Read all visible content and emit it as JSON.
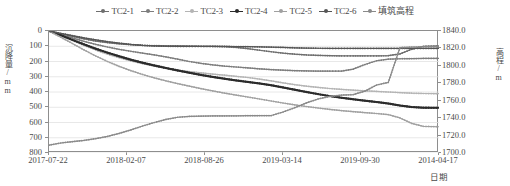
{
  "legend": {
    "items": [
      {
        "label": "TC2-1",
        "color": "#6e6e6e",
        "marker": "dot"
      },
      {
        "label": "TC2-2",
        "color": "#7d7d7d",
        "marker": "dot"
      },
      {
        "label": "TC2-3",
        "color": "#b4b4b4",
        "marker": "dot"
      },
      {
        "label": "TC2-4",
        "color": "#2b2b2b",
        "marker": "dot"
      },
      {
        "label": "TC2-5",
        "color": "#a0a0a0",
        "marker": "dot"
      },
      {
        "label": "TC2-6",
        "color": "#555555",
        "marker": "dot"
      },
      {
        "label": "填筑高程",
        "color": "#8a8a8a",
        "marker": "dot"
      }
    ]
  },
  "axes": {
    "y_left_title": "沉降量/mm",
    "y_right_title": "高程/m",
    "x_title": "日期",
    "y_left_ticks": [
      "0",
      "100",
      "200",
      "300",
      "400",
      "500",
      "600",
      "700",
      "800"
    ],
    "y_right_ticks": [
      "1840.0",
      "1820.0",
      "1800.0",
      "1780.0",
      "1760.0",
      "1740.0",
      "1720.0",
      "1700.0"
    ],
    "x_ticks": [
      "2017-07-22",
      "2018-02-07",
      "2018-08-26",
      "2019-03-14",
      "2019-09-30",
      "2014-04-17"
    ]
  },
  "chart_data": {
    "type": "line",
    "title": "",
    "xlabel": "日期",
    "ylabel": "沉降量/mm",
    "y2label": "高程/m",
    "grid": true,
    "legend_position": "top",
    "ylim": [
      800,
      0
    ],
    "y2lim": [
      1700.0,
      1840.0
    ],
    "xlim": [
      "2017-07-22",
      "2014-04-17"
    ],
    "x_tick_labels": [
      "2017-07-22",
      "2018-02-07",
      "2018-08-26",
      "2019-03-14",
      "2019-09-30",
      "2014-04-17"
    ],
    "x": [
      0,
      3,
      6,
      9,
      12,
      15,
      18,
      21,
      24,
      27,
      30,
      33,
      36,
      39,
      42,
      45,
      48,
      51,
      54,
      57,
      60,
      63,
      66,
      69,
      72,
      75,
      78,
      81,
      84,
      87,
      90,
      93,
      96,
      100
    ],
    "series": [
      {
        "name": "TC2-1",
        "color": "#6e6e6e",
        "axis": "left",
        "values": [
          0,
          18,
          35,
          52,
          66,
          76,
          84,
          90,
          94,
          96,
          97,
          98,
          99,
          100,
          101,
          103,
          108,
          116,
          126,
          136,
          145,
          152,
          157,
          160,
          162,
          163,
          163,
          163,
          163,
          162,
          150,
          120,
          100,
          98
        ]
      },
      {
        "name": "TC2-2",
        "color": "#7d7d7d",
        "axis": "left",
        "values": [
          0,
          22,
          45,
          68,
          88,
          105,
          120,
          133,
          145,
          157,
          170,
          185,
          200,
          212,
          222,
          230,
          236,
          242,
          248,
          253,
          257,
          260,
          262,
          263,
          263,
          263,
          250,
          220,
          195,
          185,
          182,
          181,
          180,
          180
        ]
      },
      {
        "name": "TC2-3",
        "color": "#b4b4b4",
        "axis": "left",
        "values": [
          0,
          30,
          62,
          95,
          125,
          152,
          175,
          196,
          214,
          230,
          244,
          256,
          266,
          275,
          283,
          290,
          297,
          305,
          315,
          327,
          340,
          352,
          362,
          370,
          377,
          383,
          388,
          392,
          396,
          400,
          404,
          408,
          410,
          411
        ]
      },
      {
        "name": "TC2-4",
        "color": "#2b2b2b",
        "axis": "left",
        "values": [
          0,
          28,
          58,
          88,
          116,
          142,
          166,
          188,
          208,
          226,
          243,
          259,
          274,
          288,
          301,
          313,
          324,
          334,
          344,
          356,
          370,
          385,
          400,
          414,
          427,
          438,
          448,
          457,
          466,
          476,
          489,
          499,
          503,
          504
        ]
      },
      {
        "name": "TC2-5",
        "color": "#a0a0a0",
        "axis": "left",
        "values": [
          0,
          40,
          82,
          124,
          164,
          200,
          232,
          260,
          285,
          307,
          327,
          345,
          362,
          378,
          393,
          407,
          420,
          433,
          446,
          459,
          472,
          484,
          495,
          505,
          514,
          522,
          529,
          535,
          541,
          548,
          570,
          606,
          625,
          628
        ]
      },
      {
        "name": "TC2-6",
        "color": "#555555",
        "axis": "left",
        "values": [
          0,
          15,
          30,
          45,
          58,
          70,
          80,
          88,
          94,
          98,
          100,
          101,
          101,
          101,
          101,
          101,
          102,
          103,
          104,
          106,
          108,
          110,
          112,
          113,
          114,
          114,
          114,
          114,
          114,
          114,
          114,
          114,
          114,
          114
        ]
      },
      {
        "name": "填筑高程",
        "color": "#8a8a8a",
        "axis": "right",
        "values": [
          1709.0,
          1711.5,
          1713.0,
          1714.5,
          1716.5,
          1719.0,
          1722.5,
          1726.5,
          1731.0,
          1735.0,
          1738.5,
          1741.0,
          1742.0,
          1742.3,
          1742.5,
          1742.6,
          1742.7,
          1742.8,
          1742.9,
          1743.0,
          1747.0,
          1752.0,
          1757.5,
          1762.0,
          1765.0,
          1766.5,
          1767.0,
          1771.0,
          1778.0,
          1781.0,
          1821.0,
          1821.5,
          1821.8,
          1822.0
        ]
      }
    ]
  }
}
